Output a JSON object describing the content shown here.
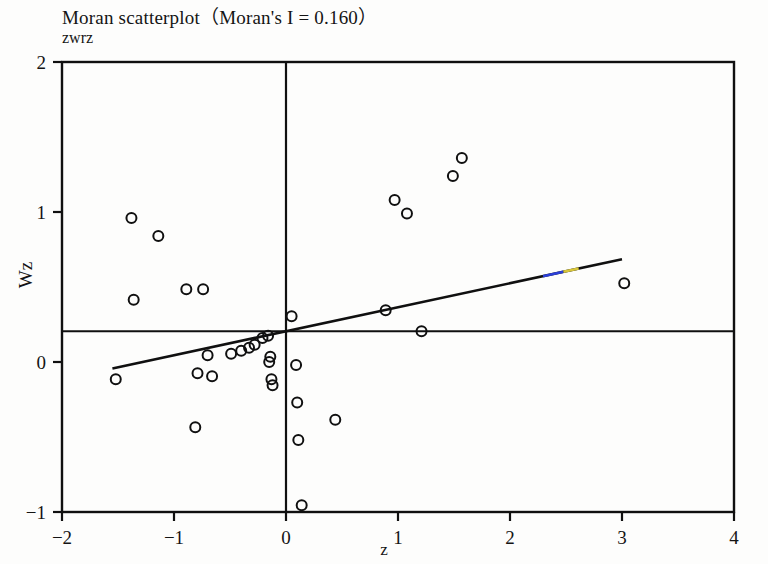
{
  "chart_data": {
    "type": "scatter",
    "title": "Moran scatterplot（Moran's I = 0.160）",
    "morans_i": 0.16,
    "top_left_label": "zwrz",
    "xlabel": "z",
    "ylabel": "Wz",
    "xlim": [
      -2,
      4
    ],
    "ylim": [
      -1,
      2
    ],
    "xticks": [
      -2,
      -1,
      0,
      1,
      2,
      3,
      4
    ],
    "xticklabels": [
      "−2",
      "−1",
      "0",
      "1",
      "2",
      "3",
      "4"
    ],
    "yticks": [
      -1,
      0,
      1,
      2
    ],
    "yticklabels": [
      "−1",
      "0",
      "1",
      "2"
    ],
    "grid": false,
    "legend": null,
    "marker": {
      "shape": "open-circle",
      "edge_color": "#101010",
      "face_color": "none",
      "radius_px": 5,
      "stroke_px": 2
    },
    "reference_lines": [
      {
        "name": "vertical-mean-line",
        "orientation": "vertical",
        "x": 0.0,
        "color": "#101010"
      },
      {
        "name": "horizontal-mean-line",
        "orientation": "horizontal",
        "y": 0.205,
        "color": "#101010"
      }
    ],
    "regression_line": {
      "name": "moran-fit-line",
      "slope": 0.16,
      "intercept": 0.205,
      "x_start": -1.55,
      "x_end": 3.0,
      "y_start": -0.043,
      "y_end": 0.685,
      "color": "#101010",
      "artifact_color_a": "#2b3fd8",
      "artifact_color_b": "#d8c63a"
    },
    "points": [
      {
        "x": -1.52,
        "y": -0.115
      },
      {
        "x": -1.38,
        "y": 0.96
      },
      {
        "x": -1.36,
        "y": 0.415
      },
      {
        "x": -1.14,
        "y": 0.84
      },
      {
        "x": -0.89,
        "y": 0.485
      },
      {
        "x": -0.81,
        "y": -0.435
      },
      {
        "x": -0.79,
        "y": -0.075
      },
      {
        "x": -0.74,
        "y": 0.485
      },
      {
        "x": -0.7,
        "y": 0.045
      },
      {
        "x": -0.66,
        "y": -0.095
      },
      {
        "x": -0.49,
        "y": 0.055
      },
      {
        "x": -0.4,
        "y": 0.075
      },
      {
        "x": -0.33,
        "y": 0.095
      },
      {
        "x": -0.28,
        "y": 0.115
      },
      {
        "x": -0.21,
        "y": 0.16
      },
      {
        "x": -0.16,
        "y": 0.175
      },
      {
        "x": -0.14,
        "y": 0.035
      },
      {
        "x": -0.15,
        "y": 0.0
      },
      {
        "x": -0.13,
        "y": -0.115
      },
      {
        "x": -0.12,
        "y": -0.155
      },
      {
        "x": 0.05,
        "y": 0.305
      },
      {
        "x": 0.09,
        "y": -0.02
      },
      {
        "x": 0.1,
        "y": -0.27
      },
      {
        "x": 0.11,
        "y": -0.52
      },
      {
        "x": 0.14,
        "y": -0.955
      },
      {
        "x": 0.44,
        "y": -0.385
      },
      {
        "x": 0.89,
        "y": 0.345
      },
      {
        "x": 0.97,
        "y": 1.08
      },
      {
        "x": 1.08,
        "y": 0.99
      },
      {
        "x": 1.21,
        "y": 0.205
      },
      {
        "x": 1.49,
        "y": 1.24
      },
      {
        "x": 1.57,
        "y": 1.36
      },
      {
        "x": 3.02,
        "y": 0.525
      }
    ]
  }
}
